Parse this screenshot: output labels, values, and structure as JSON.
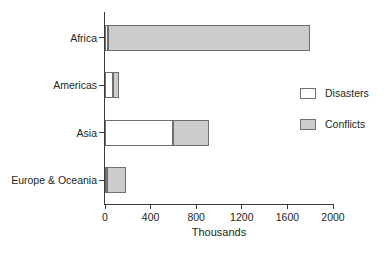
{
  "chart_data": {
    "type": "bar",
    "orientation": "horizontal",
    "stacked": true,
    "title": "",
    "xlabel": "Thousands",
    "ylabel": "",
    "xlim": [
      0,
      2000
    ],
    "xticks": [
      0,
      400,
      800,
      1200,
      1600,
      2000
    ],
    "xtick_labels": [
      "0",
      "400",
      "800",
      "1200",
      "1600",
      "2000"
    ],
    "grid": false,
    "legend_position": "inside-right",
    "categories": [
      "Africa",
      "Americas",
      "Asia",
      "Europe & Oceania"
    ],
    "series": [
      {
        "name": "Disasters",
        "color": "#ffffff",
        "values": [
          25,
          70,
          600,
          20
        ]
      },
      {
        "name": "Conflicts",
        "color": "#cccccc",
        "values": [
          1775,
          50,
          310,
          165
        ]
      }
    ],
    "totals": [
      1800,
      120,
      910,
      185
    ],
    "legend": [
      {
        "label": "Disasters",
        "swatch": "white"
      },
      {
        "label": "Conflicts",
        "swatch": "gray"
      }
    ]
  },
  "colors": {
    "axis": "#3b3b3b",
    "bar_outline": "#6e6e6e",
    "disasters_fill": "#ffffff",
    "conflicts_fill": "#cccccc",
    "text": "#231f20",
    "background": "#ffffff"
  }
}
